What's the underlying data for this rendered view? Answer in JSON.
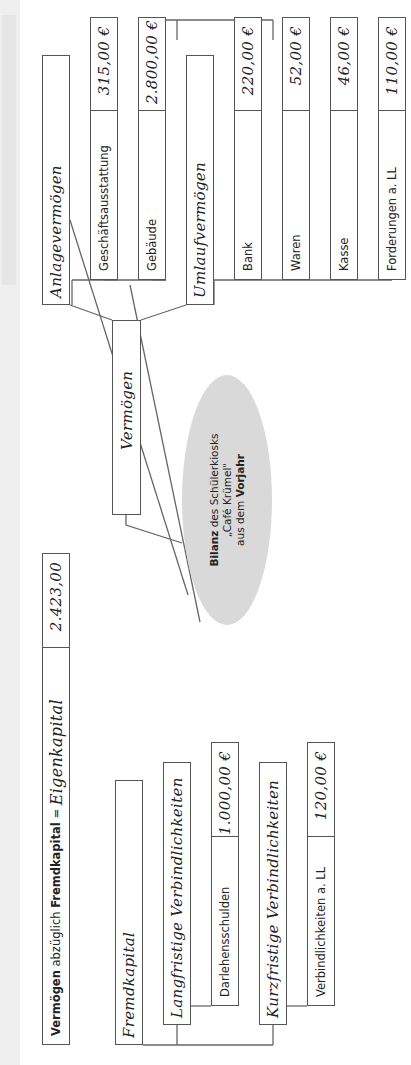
{
  "formula": {
    "part1_bold": "Vermögen",
    "part2": " abzüglich ",
    "part3_bold": "Fremdkapital",
    "part4": " = ",
    "result_label": "Eigenkapital",
    "result_value": "2.423,00"
  },
  "center": {
    "line1_bold": "Bilanz",
    "line1_rest": " des Schülerkiosks",
    "line2": "„Café Krümel\"",
    "line3_rest": "aus dem ",
    "line3_bold": "Vorjahr"
  },
  "vermoegen": {
    "label": "Vermögen",
    "anlage": {
      "label": "Anlagevermögen",
      "items": [
        {
          "label": "Geschäftsausstattung",
          "value": "315,00 €"
        },
        {
          "label": "Gebäude",
          "value": "2.800,00 €"
        }
      ]
    },
    "umlauf": {
      "label": "Umlaufvermögen",
      "items": [
        {
          "label": "Bank",
          "value": "220,00 €"
        },
        {
          "label": "Waren",
          "value": "52,00 €"
        },
        {
          "label": "Kasse",
          "value": "46,00 €"
        },
        {
          "label": "Forderungen a. LL",
          "value": "110,00 €"
        }
      ]
    }
  },
  "fremdkapital": {
    "label": "Fremdkapital",
    "langfristig": {
      "label": "Langfristige Verbindlichkeiten",
      "items": [
        {
          "label": "Darlehensschulden",
          "value": "1.000,00 €"
        }
      ]
    },
    "kurzfristig": {
      "label": "Kurzfristige Verbindlichkeiten",
      "items": [
        {
          "label": "Verbindlichkeiten a. LL",
          "value": "120,00 €"
        }
      ]
    }
  },
  "colors": {
    "border": "#555555",
    "ellipse": "#d9d9d9",
    "strip": "#efefef"
  }
}
